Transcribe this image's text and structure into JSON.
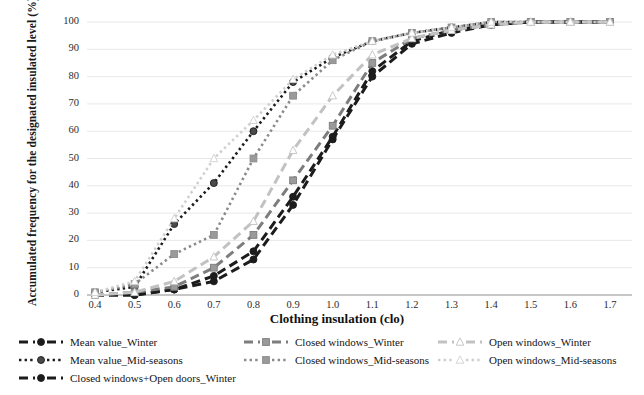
{
  "chart_data": {
    "type": "line",
    "title": "",
    "xlabel": "Clothing insulation (clo)",
    "ylabel": "Accumulated frequency for the designated insulated level (%)",
    "xlim": [
      0.35,
      1.75
    ],
    "ylim": [
      0,
      100
    ],
    "grid": true,
    "legend_position": "bottom",
    "xticks": [
      "0.4",
      "0.5",
      "0.6",
      "0.7",
      "0.8",
      "0.9",
      "1.0",
      "1.1",
      "1.2",
      "1.3",
      "1.4",
      "1.5",
      "1.6",
      "1.7"
    ],
    "yticks": [
      "0",
      "10",
      "20",
      "30",
      "40",
      "50",
      "60",
      "70",
      "80",
      "90",
      "100"
    ],
    "x": [
      0.4,
      0.5,
      0.6,
      0.7,
      0.8,
      0.9,
      1.0,
      1.1,
      1.2,
      1.3,
      1.4,
      1.5,
      1.6,
      1.7
    ],
    "series": [
      {
        "name": "Mean value_Winter",
        "color": "#1c1c1c",
        "dash": "long",
        "marker": "circle",
        "marker_fill": "#1c1c1c",
        "values": [
          0,
          0,
          2,
          5,
          13,
          33,
          57,
          80,
          92,
          96,
          99,
          100,
          100,
          100
        ]
      },
      {
        "name": "Mean value_Mid-seasons",
        "color": "#1c1c1c",
        "dash": "dot",
        "marker": "circle",
        "marker_fill": "#4a4a4a",
        "values": [
          1,
          3,
          26,
          41,
          60,
          78,
          87,
          93,
          96,
          98,
          100,
          100,
          100,
          100
        ]
      },
      {
        "name": "Closed windows+Open doors_Winter",
        "color": "#1c1c1c",
        "dash": "long",
        "marker": "circle",
        "marker_fill": "#1c1c1c",
        "values": [
          0,
          0,
          2,
          7,
          16,
          36,
          58,
          82,
          93,
          97,
          99,
          100,
          100,
          100
        ]
      },
      {
        "name": "Closed windows_Winter",
        "color": "#7d7d7d",
        "dash": "long",
        "marker": "square",
        "marker_fill": "#9a9a9a",
        "values": [
          0,
          1,
          3,
          10,
          22,
          42,
          62,
          85,
          94,
          97,
          99,
          100,
          100,
          100
        ]
      },
      {
        "name": "Closed windows_Mid-seasons",
        "color": "#8a8a8a",
        "dash": "dot",
        "marker": "square",
        "marker_fill": "#9a9a9a",
        "values": [
          1,
          4,
          15,
          22,
          50,
          73,
          86,
          93,
          96,
          98,
          100,
          100,
          100,
          100
        ]
      },
      {
        "name": "Open windows_Winter",
        "color": "#c2c2c2",
        "dash": "long",
        "marker": "triangle",
        "marker_fill": "#ffffff",
        "values": [
          0,
          1,
          5,
          14,
          27,
          53,
          73,
          88,
          94,
          97,
          99,
          100,
          100,
          100
        ]
      },
      {
        "name": "Open windows_Mid-seasons",
        "color": "#cfcfcf",
        "dash": "dot",
        "marker": "triangle",
        "marker_fill": "#ffffff",
        "values": [
          1,
          5,
          28,
          50,
          64,
          79,
          88,
          93,
          96,
          98,
          100,
          100,
          100,
          100
        ]
      }
    ]
  },
  "legend": {
    "items": [
      {
        "label": "Mean value_Winter",
        "col": 0,
        "row": 0,
        "series": 0
      },
      {
        "label": "Mean value_Mid-seasons",
        "col": 0,
        "row": 1,
        "series": 1
      },
      {
        "label": "Closed windows+Open doors_Winter",
        "col": 0,
        "row": 2,
        "series": 2
      },
      {
        "label": "Closed windows_Winter",
        "col": 1,
        "row": 0,
        "series": 3
      },
      {
        "label": "Closed windows_Mid-seasons",
        "col": 1,
        "row": 1,
        "series": 4
      },
      {
        "label": "Open windows_Winter",
        "col": 2,
        "row": 0,
        "series": 5
      },
      {
        "label": "Open windows_Mid-seasons",
        "col": 2,
        "row": 1,
        "series": 6
      }
    ]
  }
}
